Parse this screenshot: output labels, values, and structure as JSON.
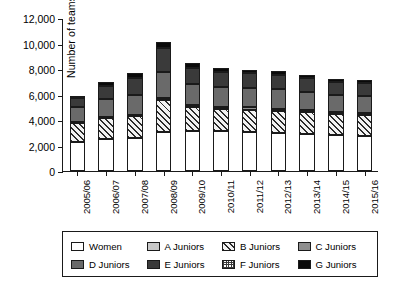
{
  "chart_data": {
    "type": "bar",
    "stacked": true,
    "title": "",
    "xlabel": "",
    "ylabel": "Number of teams",
    "ylim": [
      0,
      12000
    ],
    "ytick_step": 2000,
    "ytick_labels": [
      "0",
      "2,000",
      "4,000",
      "6,000",
      "8,000",
      "10,000",
      "12,000"
    ],
    "ytick_values": [
      0,
      2000,
      4000,
      6000,
      8000,
      10000,
      12000
    ],
    "grid": false,
    "legend_position": "bottom",
    "categories": [
      "2005/06",
      "2006/07",
      "2007/08",
      "2008/09",
      "2009/10",
      "2010/11",
      "2011/12",
      "2012/13",
      "2013/14",
      "2014/15",
      "2015/16"
    ],
    "series": [
      {
        "name": "Women",
        "key": "women",
        "fill": "white",
        "values": [
          2280,
          2540,
          2620,
          3060,
          3120,
          3100,
          3040,
          2960,
          2900,
          2820,
          2780
        ]
      },
      {
        "name": "A Juniors",
        "key": "a",
        "fill": "light-gray",
        "values": [
          0,
          0,
          0,
          0,
          0,
          0,
          0,
          0,
          0,
          0,
          0
        ]
      },
      {
        "name": "B Juniors",
        "key": "b",
        "fill": "diagonal-hatch",
        "values": [
          1450,
          1580,
          1700,
          2520,
          1900,
          1800,
          1780,
          1760,
          1700,
          1620,
          1600
        ]
      },
      {
        "name": "C Juniors",
        "key": "c",
        "fill": "medium-gray",
        "values": [
          90,
          100,
          110,
          130,
          150,
          160,
          170,
          170,
          170,
          160,
          160
        ]
      },
      {
        "name": "D Juniors",
        "key": "d",
        "fill": "dark-gray",
        "values": [
          1180,
          1400,
          1560,
          2080,
          1680,
          1560,
          1540,
          1540,
          1460,
          1400,
          1380
        ]
      },
      {
        "name": "E Juniors",
        "key": "e",
        "fill": "very-dark-gray",
        "values": [
          760,
          1080,
          1320,
          1840,
          1260,
          1120,
          1150,
          1130,
          1060,
          1000,
          980
        ]
      },
      {
        "name": "F Juniors",
        "key": "f",
        "fill": "fine-checker",
        "values": [
          0,
          0,
          0,
          0,
          0,
          0,
          0,
          0,
          0,
          0,
          0
        ]
      },
      {
        "name": "G Juniors",
        "key": "g",
        "fill": "black",
        "values": [
          140,
          250,
          390,
          470,
          340,
          310,
          270,
          290,
          260,
          250,
          250
        ]
      }
    ],
    "totals": [
      5900,
      6950,
      7700,
      10100,
      8450,
      8050,
      7950,
      7850,
      7550,
      7250,
      7150
    ]
  },
  "legend": {
    "items": [
      {
        "label": "Women"
      },
      {
        "label": "A Juniors"
      },
      {
        "label": "B Juniors"
      },
      {
        "label": "C Juniors"
      },
      {
        "label": "D Juniors"
      },
      {
        "label": "E Juniors"
      },
      {
        "label": "F Juniors"
      },
      {
        "label": "G Juniors"
      }
    ]
  },
  "colors": {
    "axis": "#1a1a1a",
    "women": "#ffffff",
    "a_juniors": "#c9c9c9",
    "c_juniors": "#8f8f8f",
    "d_juniors": "#6a6a6a",
    "e_juniors": "#3a3a3a",
    "g_juniors": "#0a0a0a"
  }
}
